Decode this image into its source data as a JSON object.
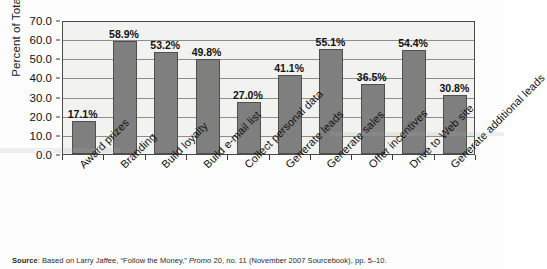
{
  "chart_data": {
    "type": "bar",
    "title": "",
    "xlabel": "",
    "ylabel": "Percent of Total",
    "ylim": [
      0,
      70
    ],
    "ytick_step": 10,
    "ytick_labels": [
      "0.0",
      "10.0",
      "20.0",
      "30.0",
      "40.0",
      "50.0",
      "60.0",
      "70.0"
    ],
    "ytick_values": [
      0,
      10,
      20,
      30,
      40,
      50,
      60,
      70
    ],
    "grid": true,
    "legend": "none",
    "bar_color": "#7f7f7f",
    "plot_background": "#f2f2f0",
    "categories": [
      "Award prizes",
      "Branding",
      "Build loyalty",
      "Build e-mail list",
      "Collect personal data",
      "Generate leads",
      "Generate sales",
      "Offer incentives",
      "Drive to Web site",
      "Generate additional leads"
    ],
    "values": [
      17.1,
      58.9,
      53.2,
      49.8,
      27.0,
      41.1,
      55.1,
      36.5,
      54.4,
      30.8
    ],
    "data_labels": [
      "17.1%",
      "58.9%",
      "53.2%",
      "49.8%",
      "27.0%",
      "41.1%",
      "55.1%",
      "36.5%",
      "54.4%",
      "30.8%"
    ]
  },
  "source": {
    "label": "Source",
    "separator": ": ",
    "text_before_italic": "Based on Larry Jaffee, “Follow the Money,” ",
    "italic_text": "Promo",
    "text_after_italic": " 20, no. 11 (November 2007 Sourcebook), pp. 5–10."
  }
}
